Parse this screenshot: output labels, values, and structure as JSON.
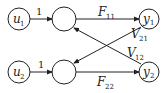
{
  "diagram": {
    "nodes": {
      "u1": {
        "main": "u",
        "sub": "1"
      },
      "u2": {
        "main": "u",
        "sub": "2"
      },
      "y1": {
        "main": "y",
        "sub": "1"
      },
      "y2": {
        "main": "y",
        "sub": "2"
      }
    },
    "edges": {
      "u1_gain": "1",
      "u2_gain": "1",
      "F11": {
        "main": "F",
        "sub": "11"
      },
      "F22": {
        "main": "F",
        "sub": "22"
      },
      "V21": {
        "main": "V",
        "sub": "21"
      },
      "V12": {
        "main": "V",
        "sub": "12"
      }
    },
    "colors": {
      "stroke": "#222222",
      "background": "#ffffff"
    }
  }
}
